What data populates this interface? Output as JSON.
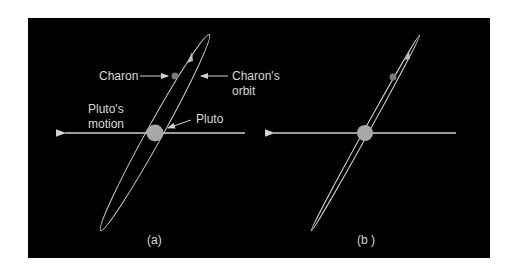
{
  "figure": {
    "background": "#000000",
    "line_color": "#cfcfcf",
    "body_color": "#a8a8a8",
    "panels": [
      {
        "id": "a",
        "caption": "(a)",
        "labels": {
          "charon": "Charon",
          "charons_orbit_line1": "Charon's",
          "charons_orbit_line2": "orbit",
          "plutos_motion_line1": "Pluto's",
          "plutos_motion_line2": "motion",
          "pluto": "Pluto"
        },
        "orbit_view": "inclined ellipse (open)"
      },
      {
        "id": "b",
        "caption": "(b )",
        "orbit_view": "nearly edge-on ellipse"
      }
    ]
  }
}
